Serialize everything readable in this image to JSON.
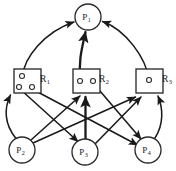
{
  "figure": {
    "kind": "resource-allocation-graph",
    "colors": {
      "stroke": "#2b2b2b",
      "edge": "#1a1a1a",
      "background": "#ffffff"
    }
  },
  "processes": [
    {
      "id": "p1",
      "label": "P",
      "sub": "1",
      "cx": 88,
      "cy": 17,
      "r": 13
    },
    {
      "id": "p2",
      "label": "P",
      "sub": "2",
      "cx": 22,
      "cy": 150,
      "r": 13
    },
    {
      "id": "p3",
      "label": "P",
      "sub": "3",
      "cx": 85,
      "cy": 152,
      "r": 13
    },
    {
      "id": "p4",
      "label": "P",
      "sub": "4",
      "cx": 148,
      "cy": 150,
      "r": 13
    }
  ],
  "resources": [
    {
      "id": "r1",
      "label": "R",
      "sub": "1",
      "x": 14,
      "y": 69,
      "w": 27,
      "h": 24,
      "label_x": 45,
      "label_y": 82,
      "instances": 3,
      "dots": [
        {
          "cx": 22,
          "cy": 76
        },
        {
          "cx": 19,
          "cy": 87
        },
        {
          "cx": 32,
          "cy": 87
        }
      ]
    },
    {
      "id": "r2",
      "label": "R",
      "sub": "2",
      "x": 73,
      "y": 69,
      "w": 27,
      "h": 24,
      "label_x": 104,
      "label_y": 82,
      "instances": 2,
      "dots": [
        {
          "cx": 80,
          "cy": 81
        },
        {
          "cx": 93,
          "cy": 81
        }
      ]
    },
    {
      "id": "r3",
      "label": "R",
      "sub": "3",
      "x": 136,
      "y": 69,
      "w": 27,
      "h": 24,
      "label_x": 167,
      "label_y": 82,
      "instances": 1,
      "dots": [
        {
          "cx": 149,
          "cy": 80
        }
      ]
    }
  ],
  "edges": [
    {
      "id": "r1-p1",
      "from": "r1",
      "to": "p1",
      "kind": "assignment",
      "style": "curve",
      "d": "M 22.5 76.5 C 24 58 44 32 74 22",
      "thick": false
    },
    {
      "id": "r2-p1",
      "from": "r2",
      "to": "p1",
      "kind": "assignment",
      "style": "curve",
      "d": "M 80.5 81 C 78 62 82 48 85.5 32",
      "thick": true
    },
    {
      "id": "r3-p1",
      "from": "r3",
      "to": "p1",
      "kind": "assignment",
      "style": "curve",
      "d": "M 149 79.5 C 146 58 126 30 102.5 21.5",
      "thick": false
    },
    {
      "id": "r1-p3",
      "from": "r1",
      "to": "p3",
      "kind": "assignment",
      "style": "line",
      "d": "M 20.5 89.5 L 78 141.5",
      "thick": false
    },
    {
      "id": "r1-p4",
      "from": "r1",
      "to": "p4",
      "kind": "assignment",
      "style": "line",
      "d": "M 33 89.5 L 137.5 145",
      "thick": false
    },
    {
      "id": "r2-p4",
      "from": "r2",
      "to": "p4",
      "kind": "assignment",
      "style": "line",
      "d": "M 94 84 L 141 139",
      "thick": false
    },
    {
      "id": "p2-r1",
      "from": "p2",
      "to": "r1",
      "kind": "request",
      "style": "curve",
      "d": "M 16 138.5 C 4 124 4 108 10.5 95",
      "thick": false
    },
    {
      "id": "p2-r2",
      "from": "p2",
      "to": "r2",
      "kind": "request",
      "style": "line",
      "d": "M 31 140 L 80 96",
      "thick": false
    },
    {
      "id": "p2-r3",
      "from": "p2",
      "to": "r3",
      "kind": "request",
      "style": "line",
      "d": "M 33 143 L 135.5 97",
      "thick": false
    },
    {
      "id": "p3-r2",
      "from": "p3",
      "to": "r2",
      "kind": "request",
      "style": "line",
      "d": "M 85.5 139 L 85.5 97",
      "thick": true
    },
    {
      "id": "p3-r3",
      "from": "p3",
      "to": "r3",
      "kind": "request",
      "style": "line",
      "d": "M 95 144 L 141 97",
      "thick": false
    },
    {
      "id": "p4-r3",
      "from": "p4",
      "to": "r3",
      "kind": "request",
      "style": "curve",
      "d": "M 155 138 C 164 124 163 108 158 96",
      "thick": false
    }
  ]
}
